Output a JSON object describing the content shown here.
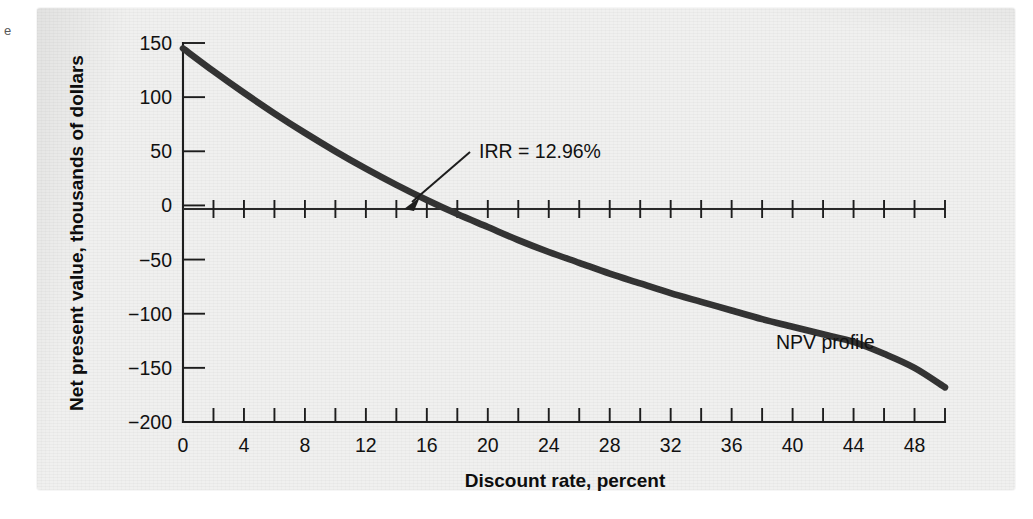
{
  "figure": {
    "margin_mark": "e"
  },
  "chart_data": {
    "type": "line",
    "title": "",
    "subtitle": "",
    "xlabel": "Discount rate, percent",
    "ylabel": "Net present value, thousands of dollars",
    "xlim": [
      0,
      50
    ],
    "ylim": [
      -200,
      150
    ],
    "grid": false,
    "legend_position": "inline-annotation",
    "x_ticks_major": [
      0,
      4,
      8,
      12,
      16,
      20,
      24,
      28,
      32,
      36,
      40,
      44,
      48
    ],
    "x_ticks_minor": [
      2,
      6,
      10,
      14,
      18,
      22,
      26,
      30,
      34,
      38,
      42,
      46,
      50
    ],
    "x_tick_labels": [
      "0",
      "4",
      "8",
      "12",
      "16",
      "20",
      "24",
      "28",
      "32",
      "36",
      "40",
      "44",
      "48"
    ],
    "y_ticks": [
      150,
      100,
      50,
      0,
      -50,
      -100,
      -150,
      -200
    ],
    "y_tick_labels": [
      "150",
      "100",
      "50",
      "0",
      "−50",
      "−100",
      "−150",
      "−200"
    ],
    "series": [
      {
        "name": "NPV profile",
        "color": "#333333",
        "x": [
          0,
          2,
          4,
          6,
          8,
          10,
          12,
          14,
          16,
          18,
          20,
          22,
          24,
          26,
          28,
          30,
          32,
          34,
          36,
          38,
          40,
          42,
          44,
          46,
          48,
          50
        ],
        "values": [
          145,
          124,
          104,
          85,
          67,
          50,
          34,
          19,
          5,
          -8,
          -20,
          -32,
          -43,
          -53,
          -63,
          -72,
          -81,
          -89,
          -97,
          -105,
          -112,
          -119,
          -126,
          -137,
          -150,
          -168
        ]
      }
    ],
    "annotations": [
      {
        "name": "irr-annotation",
        "text": "IRR = 12.96%",
        "x": 13.0,
        "y": 62,
        "points_to_x": 12.96,
        "points_to_y": 0
      },
      {
        "name": "series-annotation",
        "text": "NPV profile",
        "x": 39.5,
        "y": -95
      }
    ]
  }
}
